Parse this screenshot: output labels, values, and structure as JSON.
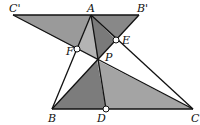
{
  "diagram": {
    "type": "geometry",
    "points": {
      "C_prime": {
        "label": "C'",
        "x": 13,
        "y": 15
      },
      "A": {
        "label": "A",
        "x": 91,
        "y": 15
      },
      "B_prime": {
        "label": "B'",
        "x": 139,
        "y": 15
      },
      "F": {
        "label": "F",
        "x": 77,
        "y": 49
      },
      "E": {
        "label": "E",
        "x": 116,
        "y": 40
      },
      "P": {
        "label": "P",
        "x": 97,
        "y": 60
      },
      "B": {
        "label": "B",
        "x": 52,
        "y": 109
      },
      "D": {
        "label": "D",
        "x": 106,
        "y": 109
      },
      "C": {
        "label": "C",
        "x": 193,
        "y": 109
      }
    },
    "colors": {
      "region_CpAF": "#9a9a9a",
      "region_AFP": "#b4b4b4",
      "region_APE": "#7a7a7a",
      "region_AEBp": "#888888",
      "region_BPD": "#7c7c7c",
      "region_DPC": "#a4a4a4",
      "line": "#111111"
    }
  }
}
